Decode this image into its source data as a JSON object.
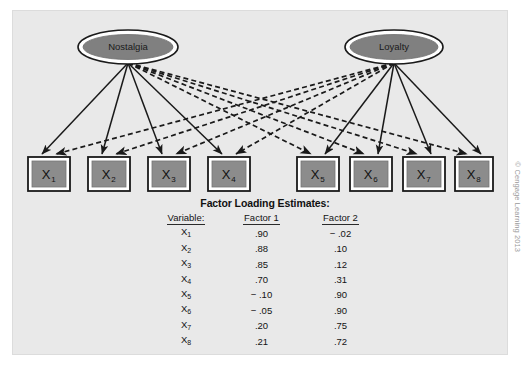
{
  "figure": {
    "copyright": "© Cengage Learning 2013",
    "panel_color": "#e9e9e9",
    "node_fill": "#808080",
    "box_fill": "#8c8c8c",
    "stroke_color": "#1a1a1a"
  },
  "factors": [
    {
      "id": "nostalgia",
      "label": "Nostalgia",
      "cx": 128,
      "cy": 47,
      "rx": 50,
      "ry": 17
    },
    {
      "id": "loyalty",
      "label": "Loyalty",
      "cx": 394,
      "cy": 47,
      "rx": 49,
      "ry": 17
    }
  ],
  "indicators": [
    {
      "id": "x1",
      "base": "X",
      "sub": "1",
      "x": 28,
      "y": 157,
      "w": 42,
      "h": 34
    },
    {
      "id": "x2",
      "base": "X",
      "sub": "2",
      "x": 88,
      "y": 157,
      "w": 42,
      "h": 34
    },
    {
      "id": "x3",
      "base": "X",
      "sub": "3",
      "x": 148,
      "y": 157,
      "w": 42,
      "h": 34
    },
    {
      "id": "x4",
      "base": "X",
      "sub": "4",
      "x": 208,
      "y": 157,
      "w": 42,
      "h": 34
    },
    {
      "id": "x5",
      "base": "X",
      "sub": "5",
      "x": 297,
      "y": 157,
      "w": 42,
      "h": 34
    },
    {
      "id": "x6",
      "base": "X",
      "sub": "6",
      "x": 350,
      "y": 157,
      "w": 42,
      "h": 34
    },
    {
      "id": "x7",
      "base": "X",
      "sub": "7",
      "x": 403,
      "y": 157,
      "w": 42,
      "h": 34
    },
    {
      "id": "x8",
      "base": "X",
      "sub": "8",
      "x": 455,
      "y": 157,
      "w": 38,
      "h": 34
    }
  ],
  "paths": {
    "solid_from_nostalgia": [
      "x1",
      "x2",
      "x3",
      "x4"
    ],
    "dashed_from_nostalgia": [
      "x5",
      "x6",
      "x7",
      "x8"
    ],
    "solid_from_loyalty": [
      "x5",
      "x6",
      "x7",
      "x8"
    ],
    "dashed_from_loyalty": [
      "x1",
      "x2",
      "x3",
      "x4"
    ]
  },
  "table": {
    "title": "Factor Loading Estimates:",
    "headers": [
      "Variable:",
      "Factor 1",
      "Factor 2"
    ],
    "rows": [
      {
        "variable_base": "X",
        "variable_sub": "1",
        "factor1": ".90",
        "factor2": "− .02"
      },
      {
        "variable_base": "X",
        "variable_sub": "2",
        "factor1": ".88",
        "factor2": ".10"
      },
      {
        "variable_base": "X",
        "variable_sub": "3",
        "factor1": ".85",
        "factor2": ".12"
      },
      {
        "variable_base": "X",
        "variable_sub": "4",
        "factor1": ".70",
        "factor2": ".31"
      },
      {
        "variable_base": "X",
        "variable_sub": "5",
        "factor1": "− .10",
        "factor2": ".90"
      },
      {
        "variable_base": "X",
        "variable_sub": "6",
        "factor1": "− .05",
        "factor2": ".90"
      },
      {
        "variable_base": "X",
        "variable_sub": "7",
        "factor1": ".20",
        "factor2": ".75"
      },
      {
        "variable_base": "X",
        "variable_sub": "8",
        "factor1": ".21",
        "factor2": ".72"
      }
    ]
  }
}
